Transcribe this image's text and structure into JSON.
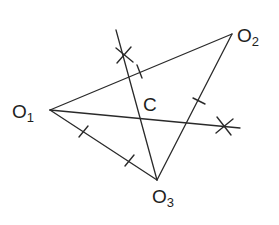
{
  "diagram": {
    "title": "",
    "points": {
      "O1": {
        "label": "O",
        "sub": "1",
        "x": 50,
        "y": 110
      },
      "O2": {
        "label": "O",
        "sub": "2",
        "x": 232,
        "y": 34
      },
      "O3": {
        "label": "O",
        "sub": "3",
        "x": 157,
        "y": 180
      },
      "C": {
        "label": "C",
        "x": 142,
        "y": 118
      }
    },
    "segments": [
      {
        "from": "O1",
        "to": "O2"
      },
      {
        "from": "O2",
        "to": "O3"
      },
      {
        "from": "O1",
        "to": "O3"
      }
    ],
    "bisectors": [
      {
        "name": "bisector-1",
        "x1": 116,
        "y1": 30,
        "x2": 157,
        "y2": 180
      },
      {
        "name": "bisector-2",
        "x1": 50,
        "y1": 110,
        "x2": 240,
        "y2": 128
      }
    ],
    "arc_marks": [
      {
        "x": 124,
        "y": 55
      },
      {
        "x": 224,
        "y": 126
      }
    ],
    "ticks": [
      {
        "on": "O1O2",
        "x": 140,
        "y": 72
      },
      {
        "on": "O2O3",
        "x": 199,
        "y": 101
      },
      {
        "on": "O1O3",
        "x": 83,
        "y": 131
      },
      {
        "on": "O1O3",
        "x": 129,
        "y": 160
      }
    ],
    "colors": {
      "line": "#2a2a2a",
      "background": "#ffffff"
    }
  }
}
